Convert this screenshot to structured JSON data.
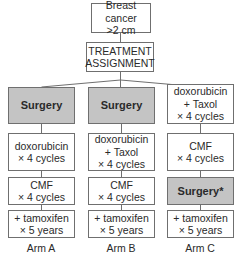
{
  "diagram": {
    "top_box": {
      "line1": "Breast cancer",
      "line2": ">2 cm"
    },
    "assignment_box": {
      "line1": "TREATMENT",
      "line2": "ASSIGNMENT"
    },
    "arms": [
      {
        "label": "Arm A",
        "steps": [
          {
            "lines": [
              "Surgery"
            ],
            "shaded": true
          },
          {
            "lines": [
              "doxorubicin",
              "× 4 cycles"
            ],
            "shaded": false
          },
          {
            "lines": [
              "CMF",
              "× 4 cycles"
            ],
            "shaded": false
          },
          {
            "lines": [
              "+ tamoxifen",
              "× 5 years"
            ],
            "shaded": false
          }
        ]
      },
      {
        "label": "Arm B",
        "steps": [
          {
            "lines": [
              "Surgery"
            ],
            "shaded": true
          },
          {
            "lines": [
              "doxorubicin",
              "+ Taxol",
              "× 4 cycles"
            ],
            "shaded": false
          },
          {
            "lines": [
              "CMF",
              "× 4 cycles"
            ],
            "shaded": false
          },
          {
            "lines": [
              "+ tamoxifen",
              "× 5 years"
            ],
            "shaded": false
          }
        ]
      },
      {
        "label": "Arm C",
        "steps": [
          {
            "lines": [
              "doxorubicin",
              "+ Taxol",
              "× 4 cycles"
            ],
            "shaded": false
          },
          {
            "lines": [
              "CMF",
              "× 4 cycles"
            ],
            "shaded": false
          },
          {
            "lines": [
              "Surgery*"
            ],
            "shaded": true
          },
          {
            "lines": [
              "+ tamoxifen",
              "× 5 years"
            ],
            "shaded": false
          }
        ]
      }
    ],
    "colors": {
      "shaded_fill": "#c4c4c4",
      "border": "#6f6f6f",
      "text": "#2a2a2a"
    }
  }
}
